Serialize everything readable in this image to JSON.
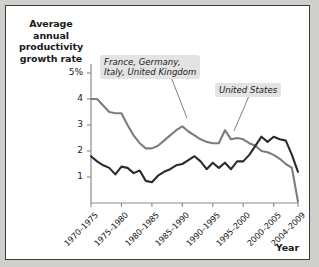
{
  "chart_data": {
    "type": "line",
    "title": "",
    "subtitle": "",
    "ylabel": "Average annual productivity growth rate",
    "xlabel": "Year",
    "grid": false,
    "legend_position": "inline-annotation",
    "ylim": [
      0,
      5
    ],
    "y_ticks": [
      "1",
      "2",
      "3",
      "4",
      "5%"
    ],
    "y_tick_values": [
      1,
      2,
      3,
      4,
      5
    ],
    "x_tick_labels": [
      "1970–1975",
      "1975–1980",
      "1980–1985",
      "1985–1990",
      "1990–1995",
      "1995–2000",
      "2000–2005",
      "2004–2009"
    ],
    "x_tick_values": [
      1972.5,
      1977.5,
      1982.5,
      1987.5,
      1992.5,
      1997.5,
      2002.5,
      2006.5
    ],
    "xlim": [
      1972.5,
      2006.5
    ],
    "series": [
      {
        "name": "France, Germany, Italy, United Kingdom",
        "color": "#7d7d7d",
        "x": [
          1972.5,
          1973.5,
          1974.5,
          1975.5,
          1976.5,
          1977.5,
          1978.5,
          1979.5,
          1980.5,
          1981.5,
          1982.5,
          1983.5,
          1984.5,
          1985.5,
          1986.5,
          1987.5,
          1988.5,
          1989.5,
          1990.5,
          1991.5,
          1992.5,
          1993.5,
          1994.5,
          1995.5,
          1996.5,
          1997.5,
          1998.5,
          1999.5,
          2000.5,
          2001.5,
          2002.5,
          2003.5,
          2004.5,
          2005.5,
          2006.5
        ],
        "values": [
          4.0,
          4.0,
          3.75,
          3.5,
          3.45,
          3.45,
          3.0,
          2.6,
          2.3,
          2.1,
          2.1,
          2.2,
          2.4,
          2.6,
          2.8,
          2.95,
          2.75,
          2.6,
          2.45,
          2.35,
          2.3,
          2.3,
          2.8,
          2.45,
          2.5,
          2.45,
          2.3,
          2.2,
          2.0,
          1.95,
          1.85,
          1.7,
          1.5,
          1.35,
          0.05
        ]
      },
      {
        "name": "United States",
        "color": "#2b2b2b",
        "x": [
          1972.5,
          1973.5,
          1974.5,
          1975.5,
          1976.5,
          1977.5,
          1978.5,
          1979.5,
          1980.5,
          1981.5,
          1982.5,
          1983.5,
          1984.5,
          1985.5,
          1986.5,
          1987.5,
          1988.5,
          1989.5,
          1990.5,
          1991.5,
          1992.5,
          1993.5,
          1994.5,
          1995.5,
          1996.5,
          1997.5,
          1998.5,
          1999.5,
          2000.5,
          2001.5,
          2002.5,
          2003.5,
          2004.5,
          2005.5,
          2006.5
        ],
        "values": [
          1.8,
          1.6,
          1.45,
          1.35,
          1.1,
          1.4,
          1.35,
          1.15,
          1.25,
          0.85,
          0.8,
          1.05,
          1.2,
          1.3,
          1.45,
          1.5,
          1.65,
          1.8,
          1.6,
          1.3,
          1.55,
          1.35,
          1.55,
          1.3,
          1.6,
          1.6,
          1.85,
          2.2,
          2.55,
          2.35,
          2.55,
          2.45,
          2.4,
          1.85,
          1.2
        ]
      }
    ],
    "annotations": [
      {
        "name": "europe-series-label",
        "text_lines": [
          "France, Germany,",
          "Italy, United Kingdom"
        ],
        "points_to_series": "France, Germany, Italy, United Kingdom"
      },
      {
        "name": "us-series-label",
        "text_lines": [
          "United States"
        ],
        "points_to_series": "United States"
      }
    ]
  },
  "labels": {
    "y_axis_title": "Average annual productivity growth rate",
    "x_axis_title": "Year",
    "europe_line1": "France, Germany,",
    "europe_line2": "Italy, United Kingdom",
    "united_states": "United States"
  },
  "colors": {
    "page_background": "#cfcfcb",
    "card_background": "#ffffff",
    "card_border": "#3a3a3a",
    "axis": "#8a8a8a",
    "text": "#1a1a1a",
    "europe_line": "#7d7d7d",
    "us_line": "#2b2b2b",
    "label_background": "#e3e3e3"
  }
}
